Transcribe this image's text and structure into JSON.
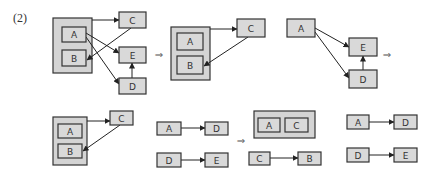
{
  "label": "(2)",
  "colors": {
    "box_fill": "#d9d9d9",
    "box_stroke": "#333333",
    "group_fill": "#d4d4d4",
    "edge": "#222222"
  },
  "implies_symbol": "⇒",
  "diagrams": [
    {
      "id": "d1",
      "groups": [
        {
          "x": 53,
          "y": 18,
          "w": 39,
          "h": 55
        }
      ],
      "nodes": [
        {
          "id": "A",
          "label": "A",
          "x": 62,
          "y": 27,
          "w": 24,
          "h": 15
        },
        {
          "id": "B",
          "label": "B",
          "x": 62,
          "y": 50,
          "w": 24,
          "h": 16
        },
        {
          "id": "C",
          "label": "C",
          "x": 119,
          "y": 12,
          "w": 27,
          "h": 16
        },
        {
          "id": "E",
          "label": "E",
          "x": 119,
          "y": 47,
          "w": 27,
          "h": 16
        },
        {
          "id": "D",
          "label": "D",
          "x": 119,
          "y": 78,
          "w": 27,
          "h": 16
        }
      ],
      "edges": [
        {
          "from": "group",
          "to": "C",
          "x1": 92,
          "y1": 20,
          "x2": 119,
          "y2": 20
        },
        {
          "from": "C",
          "to": "B",
          "x1": 131,
          "y1": 28,
          "x2": 87,
          "y2": 60
        },
        {
          "from": "A",
          "to": "E",
          "x1": 86,
          "y1": 33,
          "x2": 119,
          "y2": 53
        },
        {
          "from": "A",
          "to": "D",
          "x1": 86,
          "y1": 37,
          "x2": 119,
          "y2": 84
        },
        {
          "from": "D",
          "to": "E",
          "x1": 132,
          "y1": 78,
          "x2": 132,
          "y2": 63
        }
      ]
    },
    {
      "id": "d2",
      "groups": [
        {
          "x": 171,
          "y": 27,
          "w": 39,
          "h": 53
        }
      ],
      "nodes": [
        {
          "id": "A",
          "label": "A",
          "x": 177,
          "y": 33,
          "w": 26,
          "h": 17
        },
        {
          "id": "B",
          "label": "B",
          "x": 177,
          "y": 56,
          "w": 26,
          "h": 18
        },
        {
          "id": "C",
          "label": "C",
          "x": 237,
          "y": 19,
          "w": 28,
          "h": 18
        }
      ],
      "edges": [
        {
          "from": "group",
          "to": "C",
          "x1": 210,
          "y1": 29,
          "x2": 237,
          "y2": 29
        },
        {
          "from": "C",
          "to": "B",
          "x1": 248,
          "y1": 37,
          "x2": 204,
          "y2": 66
        }
      ]
    },
    {
      "id": "d3",
      "groups": [],
      "nodes": [
        {
          "id": "A",
          "label": "A",
          "x": 287,
          "y": 19,
          "w": 28,
          "h": 18
        },
        {
          "id": "E",
          "label": "E",
          "x": 349,
          "y": 38,
          "w": 28,
          "h": 18
        },
        {
          "id": "D",
          "label": "D",
          "x": 349,
          "y": 70,
          "w": 28,
          "h": 18
        }
      ],
      "edges": [
        {
          "from": "A",
          "to": "E",
          "x1": 315,
          "y1": 28,
          "x2": 349,
          "y2": 47
        },
        {
          "from": "A",
          "to": "D",
          "x1": 315,
          "y1": 32,
          "x2": 349,
          "y2": 78
        },
        {
          "from": "D",
          "to": "E",
          "x1": 363,
          "y1": 70,
          "x2": 363,
          "y2": 56
        }
      ]
    },
    {
      "id": "d4",
      "groups": [
        {
          "x": 53,
          "y": 117,
          "w": 34,
          "h": 48
        }
      ],
      "nodes": [
        {
          "id": "A",
          "label": "A",
          "x": 58,
          "y": 124,
          "w": 24,
          "h": 14
        },
        {
          "id": "B",
          "label": "B",
          "x": 58,
          "y": 144,
          "w": 24,
          "h": 14
        },
        {
          "id": "C",
          "label": "C",
          "x": 110,
          "y": 111,
          "w": 23,
          "h": 14
        }
      ],
      "edges": [
        {
          "from": "group",
          "to": "C",
          "x1": 87,
          "y1": 121,
          "x2": 110,
          "y2": 121
        },
        {
          "from": "C",
          "to": "B",
          "x1": 120,
          "y1": 125,
          "x2": 83,
          "y2": 151
        }
      ]
    },
    {
      "id": "d5",
      "groups": [],
      "nodes": [
        {
          "id": "A",
          "label": "A",
          "x": 157,
          "y": 122,
          "w": 24,
          "h": 13
        },
        {
          "id": "D1",
          "label": "D",
          "x": 205,
          "y": 122,
          "w": 23,
          "h": 13
        },
        {
          "id": "D2",
          "label": "D",
          "x": 157,
          "y": 153,
          "w": 24,
          "h": 14
        },
        {
          "id": "E",
          "label": "E",
          "x": 205,
          "y": 153,
          "w": 23,
          "h": 14
        }
      ],
      "edges": [
        {
          "from": "A",
          "to": "D1",
          "x1": 181,
          "y1": 128,
          "x2": 205,
          "y2": 128
        },
        {
          "from": "D2",
          "to": "E",
          "x1": 181,
          "y1": 160,
          "x2": 205,
          "y2": 160
        }
      ]
    },
    {
      "id": "d6",
      "groups": [
        {
          "x": 254,
          "y": 111,
          "w": 61,
          "h": 27
        }
      ],
      "nodes": [
        {
          "id": "A",
          "label": "A",
          "x": 258,
          "y": 118,
          "w": 22,
          "h": 14
        },
        {
          "id": "C1",
          "label": "C",
          "x": 285,
          "y": 118,
          "w": 23,
          "h": 14
        },
        {
          "id": "C2",
          "label": "C",
          "x": 249,
          "y": 152,
          "w": 21,
          "h": 13
        },
        {
          "id": "B",
          "label": "B",
          "x": 298,
          "y": 152,
          "w": 23,
          "h": 13
        }
      ],
      "edges": [
        {
          "from": "C2",
          "to": "B",
          "x1": 270,
          "y1": 158,
          "x2": 298,
          "y2": 158
        }
      ]
    },
    {
      "id": "d7",
      "groups": [],
      "nodes": [
        {
          "id": "A",
          "label": "A",
          "x": 347,
          "y": 115,
          "w": 22,
          "h": 14
        },
        {
          "id": "D1",
          "label": "D",
          "x": 394,
          "y": 115,
          "w": 23,
          "h": 14
        },
        {
          "id": "D2",
          "label": "D",
          "x": 347,
          "y": 148,
          "w": 22,
          "h": 14
        },
        {
          "id": "E",
          "label": "E",
          "x": 394,
          "y": 148,
          "w": 23,
          "h": 14
        }
      ],
      "edges": [
        {
          "from": "A",
          "to": "D1",
          "x1": 369,
          "y1": 122,
          "x2": 394,
          "y2": 122
        },
        {
          "from": "D2",
          "to": "E",
          "x1": 369,
          "y1": 155,
          "x2": 394,
          "y2": 155
        }
      ]
    }
  ],
  "implies": [
    {
      "x": 159,
      "y": 54
    },
    {
      "x": 387,
      "y": 54
    },
    {
      "x": 241,
      "y": 140
    }
  ]
}
